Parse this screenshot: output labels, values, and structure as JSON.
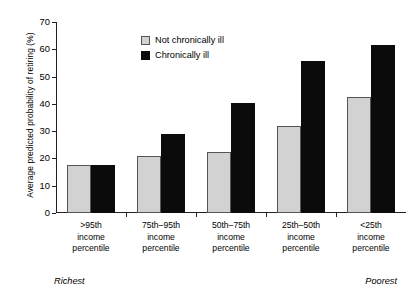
{
  "chart_data": {
    "type": "bar",
    "title": "",
    "xlabel": "",
    "ylabel": "Average predicted probability of retiring (%)",
    "ylim": [
      0,
      70
    ],
    "yticks": [
      0,
      10,
      20,
      30,
      40,
      50,
      60,
      70
    ],
    "grid": false,
    "legend_position": "upper-center",
    "categories": [
      ">95th income percentile",
      "75th–95th income percentile",
      "50th–75th income percentile",
      "25th–50th income percentile",
      "<25th income percentile"
    ],
    "category_lines": [
      [
        ">95th",
        "income",
        "percentile"
      ],
      [
        "75th–95th",
        "income",
        "percentile"
      ],
      [
        "50th–75th",
        "income",
        "percentile"
      ],
      [
        "25th–50th",
        "income",
        "percentile"
      ],
      [
        "<25th",
        "income",
        "percentile"
      ]
    ],
    "series": [
      {
        "name": "Not chronically ill",
        "color": "#d2d2d2",
        "values": [
          17.6,
          21.0,
          22.4,
          31.8,
          42.6
        ]
      },
      {
        "name": "Chronically ill",
        "color": "#0b0b0b",
        "values": [
          17.7,
          28.9,
          40.3,
          55.8,
          61.5
        ]
      }
    ],
    "annotations": [
      {
        "text": "Richest",
        "position": "bottom-left"
      },
      {
        "text": "Poorest",
        "position": "bottom-right"
      }
    ]
  }
}
